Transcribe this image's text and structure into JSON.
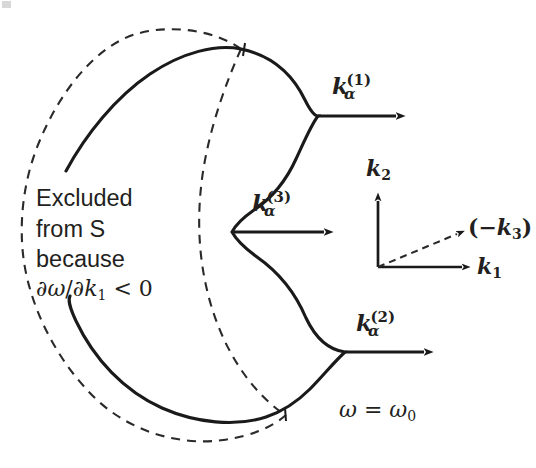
{
  "figure": {
    "background_color": "#ffffff",
    "stroke_color": "#1a1a1a",
    "width": 536,
    "height": 468
  },
  "annotation": {
    "excluded_note": {
      "line1": "Excluded",
      "line2": "from S",
      "line3": "because",
      "line4_math": "∂ω/∂k₁ < 0",
      "math_parts": {
        "numerator": "∂ω",
        "slash": "/",
        "denominator_base": "∂k",
        "denominator_sub": "1",
        "relation": "< 0"
      }
    },
    "frequency_label": {
      "base": "ω = ω",
      "sub": "0",
      "full": "ω = ω₀"
    }
  },
  "vectors": [
    {
      "id": "k-alpha-1",
      "base": "k",
      "sub": "α",
      "sup": "(1)",
      "full": "k_α^(1)",
      "label_x": 332,
      "label_y": 73,
      "line_from_x": 318,
      "line_to_x": 404,
      "line_y": 116
    },
    {
      "id": "k-alpha-3",
      "base": "k",
      "sub": "α",
      "sup": "(3)",
      "full": "k_α^(3)",
      "label_x": 252,
      "label_y": 190,
      "line_from_x": 232,
      "line_to_x": 332,
      "line_y": 232
    },
    {
      "id": "k-alpha-2",
      "base": "k",
      "sub": "α",
      "sup": "(2)",
      "full": "k_α^(2)",
      "label_x": 356,
      "label_y": 310,
      "line_from_x": 345,
      "line_to_x": 432,
      "line_y": 352
    }
  ],
  "axes": {
    "origin": {
      "x": 378,
      "y": 267
    },
    "k1": {
      "base": "k",
      "sub": "1",
      "full": "k₁",
      "tip_x": 470,
      "tip_y": 267,
      "label_x": 477,
      "label_y": 255,
      "style": "solid"
    },
    "k2": {
      "base": "k",
      "sub": "2",
      "full": "k₂",
      "tip_x": 378,
      "tip_y": 193,
      "label_x": 366,
      "label_y": 157,
      "style": "solid"
    },
    "neg_k3": {
      "open_paren": "(−",
      "base": "k",
      "sub": "3",
      "close_paren": ")",
      "full": "(−k₃)",
      "tip_x": 464,
      "tip_y": 232,
      "label_x": 470,
      "label_y": 216,
      "style": "dashed"
    }
  },
  "curves": {
    "solid": {
      "name": "omega-equals-omega0-contour",
      "style": "solid",
      "description": "kidney/bean shaped constant frequency contour with S-shaped indentation on the right",
      "open_ends": [
        {
          "x": 66,
          "y": 171
        },
        {
          "x": 70,
          "y": 296
        }
      ]
    },
    "dashed_outer": {
      "name": "excluded-branch-contour",
      "style": "dashed",
      "description": "dashed closed curve enclosing the excluded region where dw/dk1 < 0"
    },
    "dashed_inner": {
      "name": "excluded-inner-boundary",
      "style": "dashed",
      "description": "inner dashed arc crossing the solid contour near top and bottom"
    },
    "crossings": [
      {
        "x": 241,
        "y": 49
      },
      {
        "x": 285,
        "y": 415
      }
    ]
  }
}
